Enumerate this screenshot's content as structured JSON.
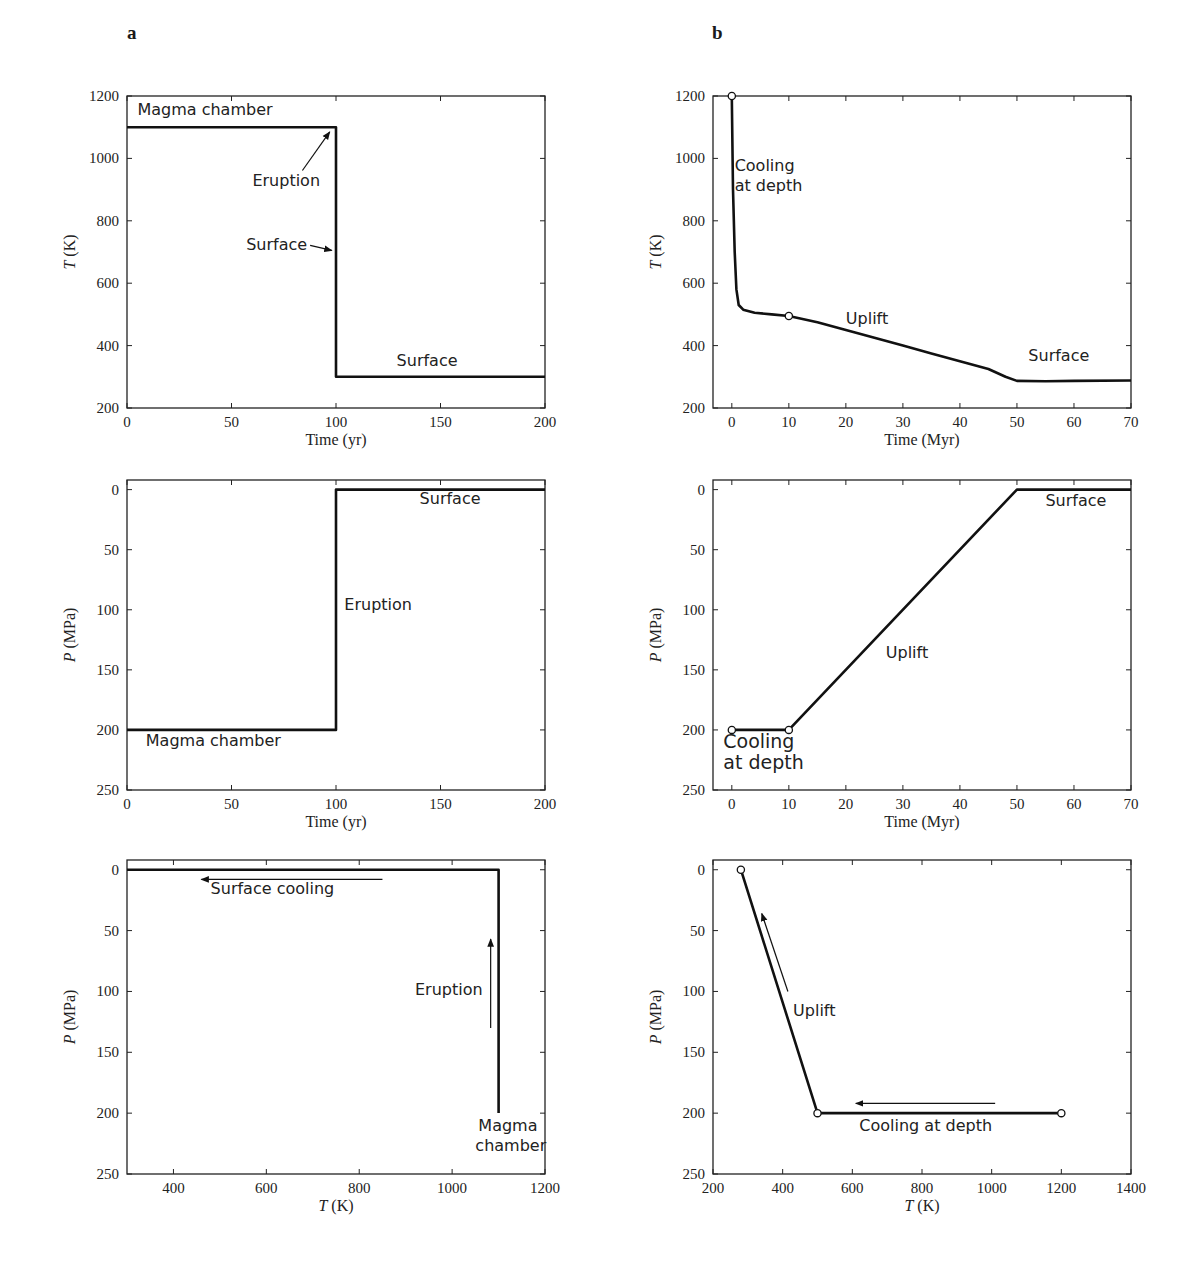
{
  "panels": {
    "a": "a",
    "b": "b"
  },
  "chart_data": [
    {
      "id": "a-top",
      "type": "line",
      "title": "",
      "xlabel": "Time (yr)",
      "ylabel": "T (K)",
      "xlim": [
        0,
        200
      ],
      "ylim": [
        200,
        1200
      ],
      "xticks": [
        0,
        50,
        100,
        150,
        200
      ],
      "yticks": [
        200,
        400,
        600,
        800,
        1000,
        1200
      ],
      "series": [
        {
          "name": "Temperature",
          "x": [
            0,
            100,
            100,
            200
          ],
          "y": [
            1100,
            1100,
            300,
            300
          ]
        }
      ],
      "annotations": [
        {
          "text": "Magma chamber",
          "x": 5,
          "y": 1140
        },
        {
          "text": "Eruption",
          "x": 60,
          "y": 910,
          "arrow_to": [
            97,
            1085
          ]
        },
        {
          "text": "Surface",
          "x": 57,
          "y": 705,
          "arrow_to": [
            98,
            705
          ]
        },
        {
          "text": "Surface",
          "x": 129,
          "y": 335
        }
      ]
    },
    {
      "id": "b-top",
      "type": "line",
      "title": "",
      "xlabel": "Time (Myr)",
      "ylabel": "T (K)",
      "xlim": [
        -3.3,
        70
      ],
      "ylim": [
        200,
        1200
      ],
      "xticks": [
        0,
        10,
        20,
        30,
        40,
        50,
        60,
        70
      ],
      "yticks": [
        200,
        400,
        600,
        800,
        1000,
        1200
      ],
      "series": [
        {
          "name": "Temperature",
          "x": [
            0,
            0.2,
            0.5,
            0.8,
            1.2,
            2,
            4,
            7,
            10,
            15,
            20,
            25,
            30,
            35,
            40,
            45,
            48,
            50,
            55,
            60,
            70
          ],
          "y": [
            1200,
            900,
            700,
            580,
            530,
            515,
            505,
            500,
            495,
            475,
            450,
            425,
            400,
            375,
            350,
            325,
            300,
            287,
            286,
            287,
            288
          ]
        }
      ],
      "markers": [
        {
          "x": 0,
          "y": 1200
        },
        {
          "x": 10,
          "y": 495
        }
      ],
      "annotations": [
        {
          "text": "Cooling at depth",
          "x": 0.5,
          "y": 960
        },
        {
          "text": "Uplift",
          "x": 20,
          "y": 470
        },
        {
          "text": "Surface",
          "x": 52,
          "y": 350
        }
      ]
    },
    {
      "id": "a-middle",
      "type": "line",
      "title": "",
      "xlabel": "Time (yr)",
      "ylabel": "P (MPa)",
      "xlim": [
        0,
        200
      ],
      "ylim": [
        250,
        -8
      ],
      "y_inverted": true,
      "xticks": [
        0,
        50,
        100,
        150,
        200
      ],
      "yticks": [
        0,
        50,
        100,
        150,
        200,
        250
      ],
      "series": [
        {
          "name": "Pressure",
          "x": [
            0,
            100,
            100,
            200
          ],
          "y": [
            200,
            200,
            0,
            0
          ]
        }
      ],
      "annotations": [
        {
          "text": "Surface",
          "x": 140,
          "y": 12
        },
        {
          "text": "Eruption",
          "x": 104,
          "y": 100
        },
        {
          "text": "Magma chamber",
          "x": 9,
          "y": 213
        }
      ]
    },
    {
      "id": "b-middle",
      "type": "line",
      "title": "",
      "xlabel": "Time (Myr)",
      "ylabel": "P (MPa)",
      "xlim": [
        -3.3,
        70
      ],
      "ylim": [
        250,
        -8
      ],
      "y_inverted": true,
      "xticks": [
        0,
        10,
        20,
        30,
        40,
        50,
        60,
        70
      ],
      "yticks": [
        0,
        50,
        100,
        150,
        200,
        250
      ],
      "series": [
        {
          "name": "Pressure",
          "x": [
            0,
            10,
            50,
            70
          ],
          "y": [
            200,
            200,
            0,
            0
          ]
        }
      ],
      "markers": [
        {
          "x": 0,
          "y": 200
        },
        {
          "x": 10,
          "y": 200
        }
      ],
      "annotations": [
        {
          "text": "Cooling at depth",
          "x": -1.5,
          "y": 215
        },
        {
          "text": "Uplift",
          "x": 27,
          "y": 140
        },
        {
          "text": "Surface",
          "x": 55,
          "y": 14
        }
      ]
    },
    {
      "id": "a-bottom",
      "type": "line",
      "title": "",
      "xlabel": "T (K)",
      "ylabel": "P (MPa)",
      "xlim": [
        300,
        1200
      ],
      "ylim": [
        250,
        -8
      ],
      "y_inverted": true,
      "xticks": [
        400,
        600,
        800,
        1000,
        1200
      ],
      "yticks": [
        0,
        50,
        100,
        150,
        200,
        250
      ],
      "series": [
        {
          "name": "P-T path",
          "x": [
            1100,
            1100,
            300
          ],
          "y": [
            200,
            0,
            0
          ]
        }
      ],
      "annotations": [
        {
          "text": "Surface cooling",
          "x": 480,
          "y": 20,
          "arrow": {
            "from": [
              850,
              8
            ],
            "to": [
              460,
              8
            ]
          }
        },
        {
          "text": "Eruption",
          "x": 920,
          "y": 103,
          "arrow": {
            "from": [
              1083,
              130
            ],
            "to": [
              1083,
              57
            ]
          }
        },
        {
          "text": "Magma chamber",
          "x": 1050,
          "y": 215
        }
      ]
    },
    {
      "id": "b-bottom",
      "type": "line",
      "title": "",
      "xlabel": "T (K)",
      "ylabel": "P (MPa)",
      "xlim": [
        200,
        1400
      ],
      "ylim": [
        250,
        -8
      ],
      "y_inverted": true,
      "xticks": [
        200,
        400,
        600,
        800,
        1000,
        1200,
        1400
      ],
      "yticks": [
        0,
        50,
        100,
        150,
        200,
        250
      ],
      "series": [
        {
          "name": "P-T path",
          "x": [
            1200,
            500,
            280
          ],
          "y": [
            200,
            200,
            0
          ]
        }
      ],
      "markers": [
        {
          "x": 280,
          "y": 0
        },
        {
          "x": 500,
          "y": 200
        },
        {
          "x": 1200,
          "y": 200
        }
      ],
      "annotations": [
        {
          "text": "Uplift",
          "x": 430,
          "y": 120,
          "arrow": {
            "from": [
              415,
              100
            ],
            "to": [
              340,
              36
            ]
          }
        },
        {
          "text": "Cooling at depth",
          "x": 620,
          "y": 215,
          "arrow": {
            "from": [
              1010,
              192
            ],
            "to": [
              610,
              192
            ]
          }
        }
      ]
    }
  ]
}
